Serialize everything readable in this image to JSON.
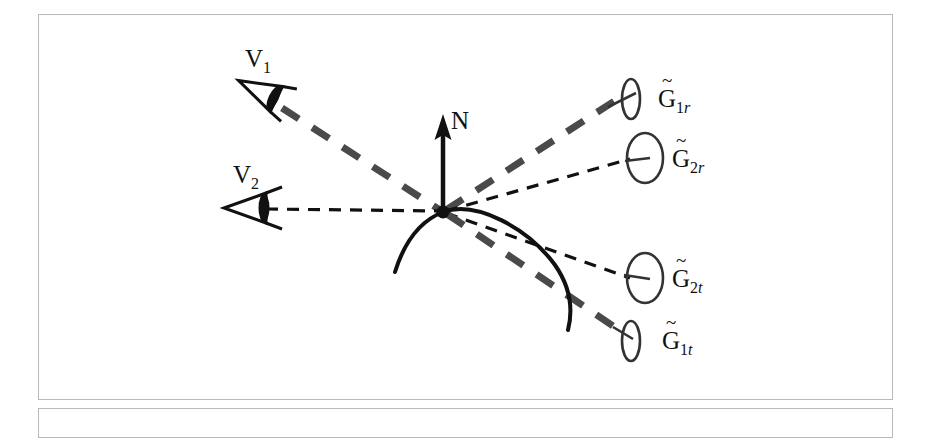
{
  "figure": {
    "type": "optical-ray-diagram",
    "title": "",
    "background_color": "#ffffff",
    "frame_color": "#b9b9b9",
    "ink_color": "#111111",
    "gray_ray_color": "#555555"
  },
  "labels": {
    "normal": "N",
    "viewer_1": {
      "base": "V",
      "sub": "1"
    },
    "viewer_2": {
      "base": "V",
      "sub": "2"
    },
    "g1r": {
      "base": "G",
      "tilde": "~",
      "sub_num": "1",
      "sub_italic": "r"
    },
    "g2r": {
      "base": "G",
      "tilde": "~",
      "sub_num": "2",
      "sub_italic": "r"
    },
    "g2t": {
      "base": "G",
      "tilde": "~",
      "sub_num": "2",
      "sub_italic": "t"
    },
    "g1t": {
      "base": "G",
      "tilde": "~",
      "sub_num": "1",
      "sub_italic": "t"
    }
  },
  "geometry": {
    "origin": {
      "x": 443,
      "y": 212
    },
    "normal_tip": {
      "x": 443,
      "y": 118
    },
    "eye_v1": {
      "x": 262,
      "y": 92,
      "rotation_deg": 28
    },
    "eye_v2": {
      "x": 250,
      "y": 208,
      "rotation_deg": 0
    },
    "target_g1r": {
      "x": 631,
      "y": 99
    },
    "target_g2r": {
      "x": 643,
      "y": 158
    },
    "target_g2t": {
      "x": 643,
      "y": 278
    },
    "target_g1t": {
      "x": 631,
      "y": 340
    }
  },
  "rays": [
    {
      "name": "v1-to-origin",
      "style": "thick-dashed-gray",
      "from": "eye_v1",
      "to": "origin"
    },
    {
      "name": "v2-to-origin",
      "style": "thin-dashed-black",
      "from": "eye_v2",
      "to": "origin"
    },
    {
      "name": "origin-to-g1r",
      "style": "thick-dashed-gray",
      "from": "origin",
      "to": "target_g1r"
    },
    {
      "name": "origin-to-g2r",
      "style": "thin-dashed-black",
      "from": "origin",
      "to": "target_g2r"
    },
    {
      "name": "origin-to-g2t",
      "style": "thin-dashed-black",
      "from": "origin",
      "to": "target_g2t"
    },
    {
      "name": "origin-to-g1t",
      "style": "thick-dashed-gray",
      "from": "origin",
      "to": "target_g1t"
    }
  ],
  "surface": {
    "name": "curved-surface",
    "style": "solid-black-curve",
    "description": "convex arc passing through origin bending down to the right"
  }
}
